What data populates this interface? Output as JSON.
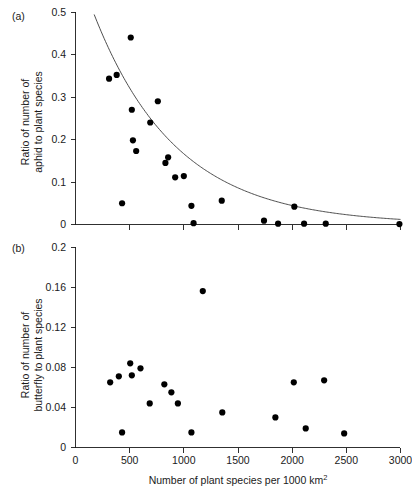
{
  "figure": {
    "panels": [
      {
        "id": "a",
        "label": "(a)",
        "ylabel_line1": "Ratio of number of",
        "ylabel_line2": "aphid to plant species",
        "ytick_labels": [
          "0",
          "0.1",
          "0.2",
          "0.3",
          "0.4",
          "0.5"
        ],
        "xtick_labels": [
          "",
          "",
          "",
          "",
          "",
          "",
          ""
        ]
      },
      {
        "id": "b",
        "label": "(b)",
        "ylabel_line1": "Ratio of number of",
        "ylabel_line2": "butterfly to plant species",
        "ytick_labels": [
          "0",
          "0.04",
          "0.08",
          "0.12",
          "0.16",
          "0.2"
        ],
        "xtick_labels": [
          "0",
          "500",
          "1000",
          "1500",
          "2000",
          "2500",
          "3000"
        ]
      }
    ],
    "xlabel_main": "Number of plant species per 1000 km",
    "xlabel_superscript": "2",
    "colors": {
      "point": "#000000",
      "curve": "#3a3a3a",
      "axis": "#1a1a1a",
      "background": "#ffffff"
    }
  },
  "chart_data": [
    {
      "type": "scatter",
      "panel": "a",
      "title": "(a)",
      "xlabel": "Number of plant species per 1000 km2",
      "ylabel": "Ratio of number of aphid to plant species",
      "xlim": [
        0,
        3000
      ],
      "ylim": [
        0,
        0.5
      ],
      "xticks": [
        0,
        500,
        1000,
        1500,
        2000,
        2500,
        3000
      ],
      "yticks": [
        0,
        0.1,
        0.2,
        0.3,
        0.4,
        0.5
      ],
      "grid": false,
      "legend": "none",
      "points": [
        {
          "x": 310,
          "y": 0.343
        },
        {
          "x": 380,
          "y": 0.352
        },
        {
          "x": 430,
          "y": 0.05
        },
        {
          "x": 510,
          "y": 0.44
        },
        {
          "x": 520,
          "y": 0.27
        },
        {
          "x": 530,
          "y": 0.198
        },
        {
          "x": 560,
          "y": 0.173
        },
        {
          "x": 690,
          "y": 0.24
        },
        {
          "x": 760,
          "y": 0.29
        },
        {
          "x": 830,
          "y": 0.145
        },
        {
          "x": 855,
          "y": 0.158
        },
        {
          "x": 920,
          "y": 0.111
        },
        {
          "x": 1000,
          "y": 0.114
        },
        {
          "x": 1070,
          "y": 0.044
        },
        {
          "x": 1090,
          "y": 0.003
        },
        {
          "x": 1350,
          "y": 0.056
        },
        {
          "x": 1740,
          "y": 0.009
        },
        {
          "x": 1870,
          "y": 0.002
        },
        {
          "x": 2020,
          "y": 0.042
        },
        {
          "x": 2110,
          "y": 0.002
        },
        {
          "x": 2310,
          "y": 0.002
        },
        {
          "x": 2990,
          "y": 0.001
        }
      ],
      "fit_curve": {
        "label": "exponential decay fit",
        "equation": "y = 0.62 * exp(-x / 760)",
        "a": 0.62,
        "b": 760,
        "x_start": 120,
        "x_end": 3000
      }
    },
    {
      "type": "scatter",
      "panel": "b",
      "title": "(b)",
      "xlabel": "Number of plant species per 1000 km2",
      "ylabel": "Ratio of number of butterfly to plant species",
      "xlim": [
        0,
        3000
      ],
      "ylim": [
        0,
        0.2
      ],
      "xticks": [
        0,
        500,
        1000,
        1500,
        2000,
        2500,
        3000
      ],
      "yticks": [
        0,
        0.04,
        0.08,
        0.12,
        0.16,
        0.2
      ],
      "grid": false,
      "legend": "none",
      "points": [
        {
          "x": 320,
          "y": 0.065
        },
        {
          "x": 400,
          "y": 0.071
        },
        {
          "x": 430,
          "y": 0.015
        },
        {
          "x": 505,
          "y": 0.084
        },
        {
          "x": 520,
          "y": 0.072
        },
        {
          "x": 600,
          "y": 0.079
        },
        {
          "x": 685,
          "y": 0.044
        },
        {
          "x": 820,
          "y": 0.063
        },
        {
          "x": 885,
          "y": 0.055
        },
        {
          "x": 945,
          "y": 0.044
        },
        {
          "x": 1070,
          "y": 0.015
        },
        {
          "x": 1175,
          "y": 0.156
        },
        {
          "x": 1355,
          "y": 0.035
        },
        {
          "x": 1845,
          "y": 0.03
        },
        {
          "x": 2015,
          "y": 0.065
        },
        {
          "x": 2125,
          "y": 0.019
        },
        {
          "x": 2295,
          "y": 0.067
        },
        {
          "x": 2480,
          "y": 0.014
        }
      ]
    }
  ]
}
